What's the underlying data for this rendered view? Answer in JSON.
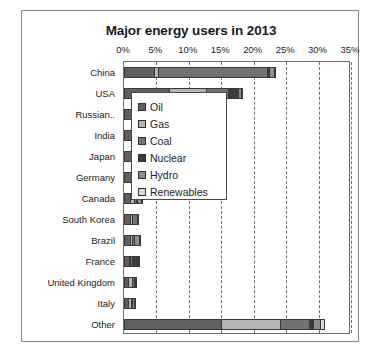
{
  "chart_data": {
    "type": "bar",
    "orientation": "horizontal",
    "stacked": true,
    "title": "Major energy users in 2013",
    "xlabel": "",
    "ylabel": "",
    "xlim": [
      0,
      35
    ],
    "xticks": [
      "0%",
      "5%",
      "10%",
      "15%",
      "20%",
      "25%",
      "30%",
      "35%"
    ],
    "xtick_values": [
      0,
      5,
      10,
      15,
      20,
      25,
      30,
      35
    ],
    "grid": true,
    "legend_position": "center",
    "categories": [
      "China",
      "USA",
      "Russian..",
      "India",
      "Japan",
      "Germany",
      "Canada",
      "South Korea",
      "Brazil",
      "France",
      "United Kingdom",
      "Italy",
      "Other"
    ],
    "series": [
      {
        "name": "Oil",
        "color": "#606060",
        "values": [
          4.6,
          7.0,
          1.4,
          1.6,
          1.8,
          1.1,
          0.9,
          0.9,
          1.0,
          0.7,
          0.6,
          0.6,
          15.0
        ]
      },
      {
        "name": "Gas",
        "color": "#b4b4b4",
        "values": [
          0.7,
          5.7,
          3.1,
          0.9,
          0.9,
          0.6,
          0.7,
          0.4,
          0.3,
          0.3,
          0.6,
          0.5,
          9.0
        ]
      },
      {
        "name": "Coal",
        "color": "#717171",
        "values": [
          16.7,
          3.3,
          0.6,
          2.0,
          0.9,
          0.6,
          0.2,
          0.7,
          0.1,
          0.1,
          0.3,
          0.1,
          4.5
        ]
      },
      {
        "name": "Nuclear",
        "color": "#3c3c3c",
        "values": [
          0.3,
          1.6,
          0.4,
          0.1,
          0.0,
          0.2,
          0.2,
          0.3,
          0.0,
          0.8,
          0.1,
          0.0,
          0.7
        ]
      },
      {
        "name": "Hydro",
        "color": "#8d8d8d",
        "values": [
          0.8,
          0.4,
          0.4,
          0.2,
          0.2,
          0.1,
          0.6,
          0.0,
          0.8,
          0.1,
          0.0,
          0.1,
          1.0
        ]
      },
      {
        "name": "Renewables",
        "color": "#d8d8d8",
        "values": [
          0.2,
          0.4,
          0.0,
          0.1,
          0.2,
          0.3,
          0.1,
          0.0,
          0.1,
          0.1,
          0.1,
          0.1,
          0.8
        ]
      }
    ],
    "totals": [
      23.3,
      18.4,
      5.9,
      4.9,
      4.0,
      2.9,
      2.7,
      2.3,
      2.3,
      2.1,
      1.7,
      1.4,
      31.0
    ]
  }
}
